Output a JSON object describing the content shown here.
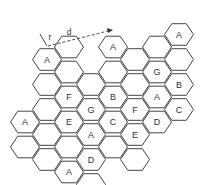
{
  "diagram": {
    "annotations": {
      "radius_label": "r",
      "distance_label": "d"
    },
    "cells": [
      {
        "col": 0,
        "row": 4,
        "label": "A"
      },
      {
        "col": 0,
        "row": 5,
        "label": ""
      },
      {
        "col": 1,
        "row": 1,
        "label": "A"
      },
      {
        "col": 1,
        "row": 2,
        "label": ""
      },
      {
        "col": 1,
        "row": 3,
        "label": ""
      },
      {
        "col": 1,
        "row": 4,
        "label": ""
      },
      {
        "col": 1,
        "row": 5,
        "label": ""
      },
      {
        "col": 2,
        "row": 1,
        "label": ""
      },
      {
        "col": 2,
        "row": 2,
        "label": ""
      },
      {
        "col": 2,
        "row": 3,
        "label": "F"
      },
      {
        "col": 2,
        "row": 4,
        "label": "E"
      },
      {
        "col": 2,
        "row": 5,
        "label": ""
      },
      {
        "col": 2,
        "row": 6,
        "label": "A"
      },
      {
        "col": 3,
        "row": 2,
        "label": ""
      },
      {
        "col": 3,
        "row": 3,
        "label": "G"
      },
      {
        "col": 3,
        "row": 4,
        "label": "A"
      },
      {
        "col": 3,
        "row": 5,
        "label": "D"
      },
      {
        "col": 3,
        "row": 6,
        "label": ""
      },
      {
        "col": 4,
        "row": 1,
        "label": "A"
      },
      {
        "col": 4,
        "row": 2,
        "label": ""
      },
      {
        "col": 4,
        "row": 3,
        "label": "B"
      },
      {
        "col": 4,
        "row": 4,
        "label": "C"
      },
      {
        "col": 4,
        "row": 5,
        "label": ""
      },
      {
        "col": 5,
        "row": 1,
        "label": ""
      },
      {
        "col": 5,
        "row": 2,
        "label": ""
      },
      {
        "col": 5,
        "row": 3,
        "label": "F"
      },
      {
        "col": 5,
        "row": 4,
        "label": "E"
      },
      {
        "col": 5,
        "row": 5,
        "label": ""
      },
      {
        "col": 6,
        "row": 1,
        "label": ""
      },
      {
        "col": 6,
        "row": 2,
        "label": "G"
      },
      {
        "col": 6,
        "row": 3,
        "label": "A"
      },
      {
        "col": 6,
        "row": 4,
        "label": "D"
      },
      {
        "col": 7,
        "row": 0,
        "label": "A"
      },
      {
        "col": 7,
        "row": 1,
        "label": ""
      },
      {
        "col": 7,
        "row": 2,
        "label": "B"
      },
      {
        "col": 7,
        "row": 3,
        "label": "C"
      }
    ]
  }
}
